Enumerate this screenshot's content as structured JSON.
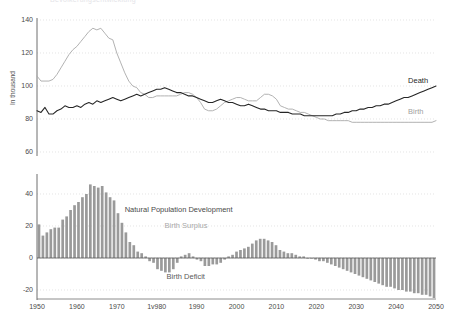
{
  "title_clipped": "Bevölkerungsentwicklung",
  "colors": {
    "birth": "#a9a9a9",
    "death": "#262626",
    "bar": "#9a9a9a",
    "grid": "#d8d8d8",
    "axis": "#6f6f6f",
    "text": "#4a4a4a"
  },
  "axes": {
    "ylabel": "In thousand",
    "upper_ticks": [
      "140",
      "120",
      "100",
      "80",
      "60"
    ],
    "lower_ticks": [
      "40",
      "20",
      "0",
      "-20"
    ],
    "x_ticks": [
      "1950",
      "1960",
      "1970",
      "1v980",
      "1990",
      "2000",
      "2010",
      "2020",
      "2030",
      "2040",
      "2050"
    ]
  },
  "labels": {
    "death": "Death",
    "birth": "Birth",
    "natural_population_development": "Natural Population Development",
    "birth_surplus": "Birth Surplus",
    "birth_deficit": "Birth Deficit"
  },
  "chart_data": {
    "type": "line",
    "title": "",
    "xlabel": "",
    "ylabel": "In thousand",
    "xlim": [
      1950,
      2050
    ],
    "ylim": [
      60,
      140
    ],
    "grid": true,
    "legend": "inline-right",
    "x": [
      1950,
      1951,
      1952,
      1953,
      1954,
      1955,
      1956,
      1957,
      1958,
      1959,
      1960,
      1961,
      1962,
      1963,
      1964,
      1965,
      1966,
      1967,
      1968,
      1969,
      1970,
      1971,
      1972,
      1973,
      1974,
      1975,
      1976,
      1977,
      1978,
      1979,
      1980,
      1981,
      1982,
      1983,
      1984,
      1985,
      1986,
      1987,
      1988,
      1989,
      1990,
      1991,
      1992,
      1993,
      1994,
      1995,
      1996,
      1997,
      1998,
      1999,
      2000,
      2001,
      2002,
      2003,
      2004,
      2005,
      2006,
      2007,
      2008,
      2009,
      2010,
      2011,
      2012,
      2013,
      2014,
      2015,
      2016,
      2017,
      2018,
      2019,
      2020,
      2021,
      2022,
      2023,
      2024,
      2025,
      2026,
      2027,
      2028,
      2029,
      2030,
      2031,
      2032,
      2033,
      2034,
      2035,
      2036,
      2037,
      2038,
      2039,
      2040,
      2041,
      2042,
      2043,
      2044,
      2045,
      2046,
      2047,
      2048,
      2049,
      2050
    ],
    "series": [
      {
        "name": "Birth",
        "color": "#a9a9a9",
        "values": [
          106,
          103,
          103,
          103,
          104,
          107,
          111,
          115,
          119,
          122,
          124,
          127,
          130,
          133,
          135,
          134,
          135,
          132,
          129,
          128,
          120,
          114,
          108,
          103,
          100,
          99,
          96,
          95,
          93,
          93,
          94,
          94,
          94,
          94,
          94,
          94,
          95,
          96,
          96,
          95,
          93,
          90,
          86,
          85,
          85,
          86,
          88,
          90,
          91,
          92,
          93,
          93,
          92,
          91,
          91,
          91,
          93,
          95,
          95,
          94,
          92,
          88,
          87,
          86,
          86,
          85,
          84,
          84,
          83,
          82,
          81,
          80,
          80,
          79,
          79,
          79,
          79,
          79,
          79,
          78,
          78,
          78,
          78,
          78,
          78,
          78,
          78,
          78,
          78,
          78,
          78,
          78,
          78,
          78,
          78,
          78,
          78,
          78,
          78,
          78,
          79
        ]
      },
      {
        "name": "Death",
        "color": "#262626",
        "values": [
          85,
          84,
          87,
          83,
          83,
          85,
          86,
          88,
          87,
          87,
          88,
          87,
          89,
          90,
          89,
          91,
          90,
          91,
          92,
          93,
          92,
          91,
          92,
          93,
          94,
          95,
          94,
          95,
          96,
          97,
          98,
          98,
          99,
          98,
          97,
          96,
          96,
          95,
          94,
          94,
          93,
          92,
          91,
          90,
          90,
          91,
          92,
          91,
          90,
          90,
          89,
          88,
          88,
          89,
          88,
          87,
          86,
          86,
          85,
          85,
          85,
          84,
          84,
          84,
          83,
          83,
          83,
          82,
          82,
          82,
          82,
          82,
          82,
          82,
          82,
          83,
          83,
          84,
          84,
          85,
          85,
          86,
          86,
          87,
          87,
          88,
          88,
          89,
          89,
          90,
          91,
          92,
          93,
          93,
          94,
          95,
          96,
          97,
          98,
          99,
          100
        ]
      }
    ]
  },
  "chart_data_lower": {
    "type": "bar",
    "title": "Natural Population Development",
    "xlabel": "",
    "ylabel": "In thousand",
    "ylim": [
      -25,
      50
    ],
    "grid": true,
    "positive_label": "Birth Surplus",
    "negative_label": "Birth Deficit",
    "x": [
      1950,
      1951,
      1952,
      1953,
      1954,
      1955,
      1956,
      1957,
      1958,
      1959,
      1960,
      1961,
      1962,
      1963,
      1964,
      1965,
      1966,
      1967,
      1968,
      1969,
      1970,
      1971,
      1972,
      1973,
      1974,
      1975,
      1976,
      1977,
      1978,
      1979,
      1980,
      1981,
      1982,
      1983,
      1984,
      1985,
      1986,
      1987,
      1988,
      1989,
      1990,
      1991,
      1992,
      1993,
      1994,
      1995,
      1996,
      1997,
      1998,
      1999,
      2000,
      2001,
      2002,
      2003,
      2004,
      2005,
      2006,
      2007,
      2008,
      2009,
      2010,
      2011,
      2012,
      2013,
      2014,
      2015,
      2016,
      2017,
      2018,
      2019,
      2020,
      2021,
      2022,
      2023,
      2024,
      2025,
      2026,
      2027,
      2028,
      2029,
      2030,
      2031,
      2032,
      2033,
      2034,
      2035,
      2036,
      2037,
      2038,
      2039,
      2040,
      2041,
      2042,
      2043,
      2044,
      2045,
      2046,
      2047,
      2048,
      2049,
      2050
    ],
    "values": [
      21,
      14,
      16,
      18,
      19,
      19,
      24,
      26,
      30,
      33,
      35,
      38,
      40,
      46,
      45,
      44,
      45,
      41,
      38,
      36,
      28,
      22,
      16,
      10,
      8,
      4,
      3,
      1,
      -2,
      -3,
      -7,
      -8,
      -9,
      -9,
      -7,
      -3,
      1,
      2,
      3,
      1,
      -1,
      -2,
      -5,
      -5,
      -4,
      -4,
      -3,
      -1,
      1,
      2,
      4,
      5,
      6,
      7,
      9,
      11,
      12,
      12,
      11,
      10,
      8,
      5,
      4,
      3,
      3,
      2,
      1,
      1,
      0,
      0,
      -1,
      -2,
      -2,
      -3,
      -4,
      -5,
      -6,
      -7,
      -8,
      -9,
      -10,
      -11,
      -12,
      -13,
      -14,
      -15,
      -16,
      -17,
      -18,
      -18,
      -19,
      -20,
      -20,
      -21,
      -21,
      -22,
      -22,
      -23,
      -23,
      -24,
      -25
    ]
  }
}
